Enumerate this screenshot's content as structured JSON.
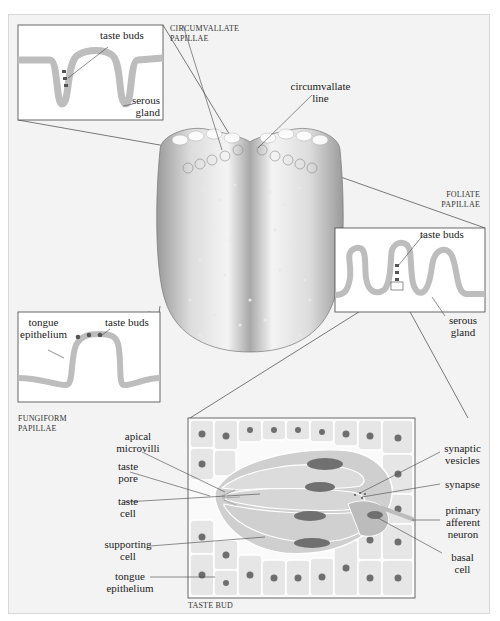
{
  "figure": {
    "captions": {
      "circumvallate": [
        "CIRCUMVALLATE",
        "PAPILLAE"
      ],
      "foliate": [
        "FOLIATE",
        "PAPILLAE"
      ],
      "fungiform": [
        "FUNGIFORM",
        "PAPILLAE"
      ],
      "taste_bud": "TASTE BUD"
    },
    "circumvallate_inset": {
      "taste_buds": "taste buds",
      "serous_gland": [
        "serous",
        "gland"
      ]
    },
    "tongue": {
      "circumvallate_line": [
        "circumvallate",
        "line"
      ]
    },
    "foliate_inset": {
      "taste_buds": "taste buds",
      "serous_gland": [
        "serous",
        "gland"
      ]
    },
    "fungiform_inset": {
      "tongue_epithelium": [
        "tongue",
        "epithelium"
      ],
      "taste_buds": "taste buds"
    },
    "taste_bud_detail": {
      "left_labels": {
        "apical_microvilli": [
          "apical",
          "microvilli"
        ],
        "taste_pore": [
          "taste",
          "pore"
        ],
        "taste_cell": [
          "taste",
          "cell"
        ],
        "supporting_cell": [
          "supporting",
          "cell"
        ],
        "tongue_epithelium": [
          "tongue",
          "epithelium"
        ]
      },
      "right_labels": {
        "synaptic_vesicles": [
          "synaptic",
          "vesicles"
        ],
        "synapse": "synapse",
        "primary_afferent_neuron": [
          "primary",
          "afferent",
          "neuron"
        ],
        "basal_cell": [
          "basal",
          "cell"
        ]
      }
    },
    "colors": {
      "background": "#f3f3f3",
      "epithelium": "#bdbdbd",
      "nucleus": "#6e6e6e",
      "cell": "#e4e4e4",
      "line": "#333333"
    }
  }
}
